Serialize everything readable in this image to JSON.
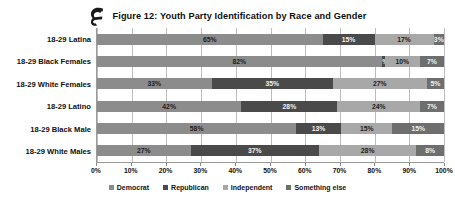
{
  "figure": {
    "logo_icon": "circle-e-logo-icon",
    "title": "Figure 12: Youth Party Identification by Race and Gender"
  },
  "chart_data": {
    "type": "bar",
    "orientation": "horizontal",
    "stacked": true,
    "title": "Figure 12: Youth Party Identification by Race and Gender",
    "xlabel": "",
    "ylabel": "",
    "xlim": [
      0,
      100
    ],
    "grid": true,
    "legend_position": "bottom",
    "xticks": [
      "0%",
      "10%",
      "20%",
      "30%",
      "40%",
      "50%",
      "60%",
      "70%",
      "80%",
      "90%",
      "100%"
    ],
    "categories": [
      "18-29 Latina",
      "18-29 Black Females",
      "18-29 White Females",
      "18-29 Latino",
      "18-29 Black Male",
      "18-29 White Males"
    ],
    "series": [
      {
        "name": "Democrat",
        "color": "#8c8c8c",
        "values": [
          65,
          82,
          33,
          42,
          58,
          27
        ],
        "labels": [
          "65%",
          "82%",
          "33%",
          "42%",
          "58%",
          "27%"
        ]
      },
      {
        "name": "Republican",
        "color": "#4a4a4a",
        "values": [
          15,
          1,
          35,
          28,
          13,
          37
        ],
        "labels": [
          "15%",
          "1%",
          "35%",
          "28%",
          "13%",
          "37%"
        ]
      },
      {
        "name": "Independent",
        "color": "#a8a8a8",
        "values": [
          17,
          10,
          27,
          24,
          15,
          28
        ],
        "labels": [
          "17%",
          "10%",
          "27%",
          "24%",
          "15%",
          "28%"
        ]
      },
      {
        "name": "Something else",
        "color": "#6e6e6e",
        "values": [
          3,
          7,
          5,
          7,
          15,
          8
        ],
        "labels": [
          "3%",
          "7%",
          "5%",
          "7%",
          "15%",
          "8%"
        ]
      }
    ]
  }
}
